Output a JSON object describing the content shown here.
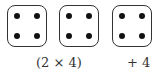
{
  "dice": [
    {
      "pips": 4,
      "left": 7
    },
    {
      "pips": 4,
      "left": 59
    },
    {
      "pips": 4,
      "left": 112
    }
  ],
  "labels": {
    "group": "(2 × 4)",
    "extra": "+ 4"
  },
  "colors": {
    "border": "#333333",
    "pip": "#111111"
  }
}
